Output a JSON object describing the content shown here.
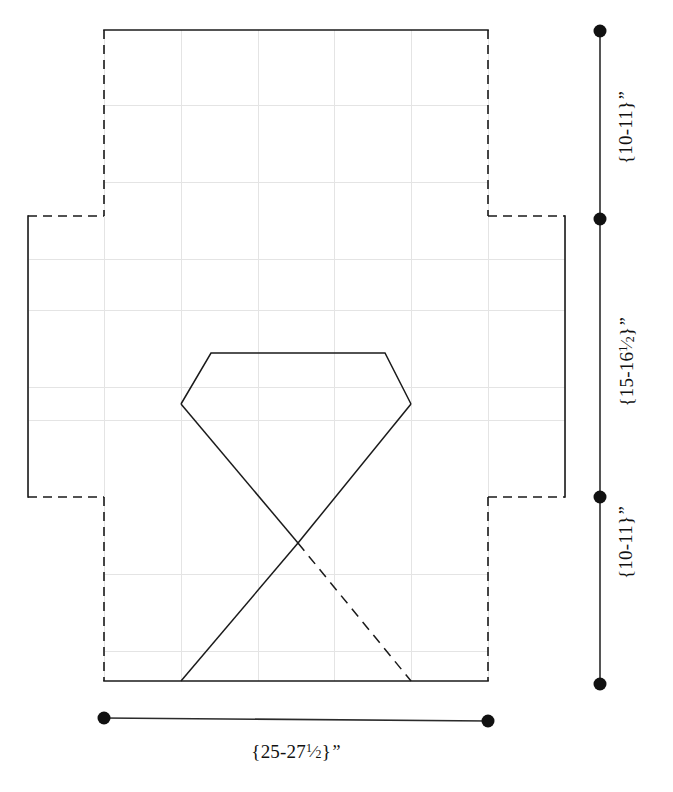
{
  "diagram": {
    "colors": {
      "outline": "#1a1a1a",
      "grid": "#e2e2e2",
      "dimension": "#111111",
      "background": "#ffffff"
    },
    "dimensions": {
      "vertical": [
        {
          "id": "top-flap",
          "whole_range": "{10-11}",
          "unit": "\"",
          "text": "{10-11}\"",
          "from_y": 31,
          "to_y": 219
        },
        {
          "id": "middle-panel",
          "whole_range": "{15-16",
          "fraction_numerator": "1",
          "fraction_denominator": "2",
          "suffix": "}",
          "unit": "\"",
          "text": "{15-16 1/2}\"",
          "from_y": 219,
          "to_y": 497
        },
        {
          "id": "bottom-flap",
          "whole_range": "{10-11}",
          "unit": "\"",
          "text": "{10-11}\"",
          "from_y": 497,
          "to_y": 684
        }
      ],
      "horizontal": [
        {
          "id": "overall-width",
          "whole_range": "{25-27",
          "fraction_numerator": "1",
          "fraction_denominator": "2",
          "suffix": "}",
          "unit": "\"",
          "text": "{25-27 1/2}\"",
          "from_x": 104,
          "to_x": 488
        }
      ]
    },
    "grid": {
      "visible": true,
      "spacing_px": 77,
      "x_lines": [
        104,
        181,
        258,
        334,
        411,
        488,
        565
      ],
      "y_lines": [
        105,
        182,
        259,
        310,
        387,
        420,
        497,
        574,
        651
      ]
    },
    "geometry": {
      "blank_outline_note": "cross-shaped box blank; solid top and bottom edges, dashed fold lines",
      "gem": {
        "top_left": [
          211,
          353
        ],
        "top_right": [
          385,
          353
        ],
        "left_shoulder": [
          181,
          404
        ],
        "right_shoulder": [
          411,
          404
        ],
        "apex_bottom": [
          298,
          543
        ]
      },
      "cross_lines": {
        "solid_ascending": [
          [
            411,
            404
          ],
          [
            181,
            681
          ]
        ],
        "dashed_descending": [
          [
            298,
            543
          ],
          [
            411,
            681
          ]
        ]
      }
    }
  }
}
